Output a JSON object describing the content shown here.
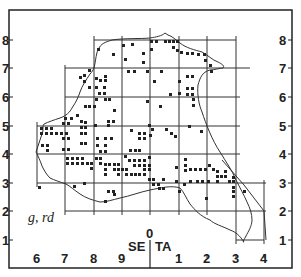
{
  "map": {
    "frame": {
      "left": 9,
      "top": 10,
      "right": 292,
      "bottom": 268
    },
    "colors": {
      "frame": "#222222",
      "grid": "#333333",
      "coast": "#333333",
      "dot": "#222222",
      "background": "#ffffff"
    },
    "y_axis": {
      "labels": [
        "8",
        "7",
        "6",
        "5",
        "4",
        "3",
        "2",
        "1"
      ],
      "positions": [
        40,
        68,
        97,
        126,
        154,
        183,
        211,
        240
      ]
    },
    "x_axis": {
      "labels": [
        "6",
        "7",
        "8",
        "9",
        "1",
        "2",
        "3",
        "4"
      ],
      "positions": [
        37,
        65,
        94,
        122,
        179,
        207,
        236,
        264
      ]
    },
    "zone_labels": {
      "left": "SE",
      "right": "TA",
      "center": "0"
    },
    "corner_label": "g, rd",
    "divider_x": 150
  }
}
